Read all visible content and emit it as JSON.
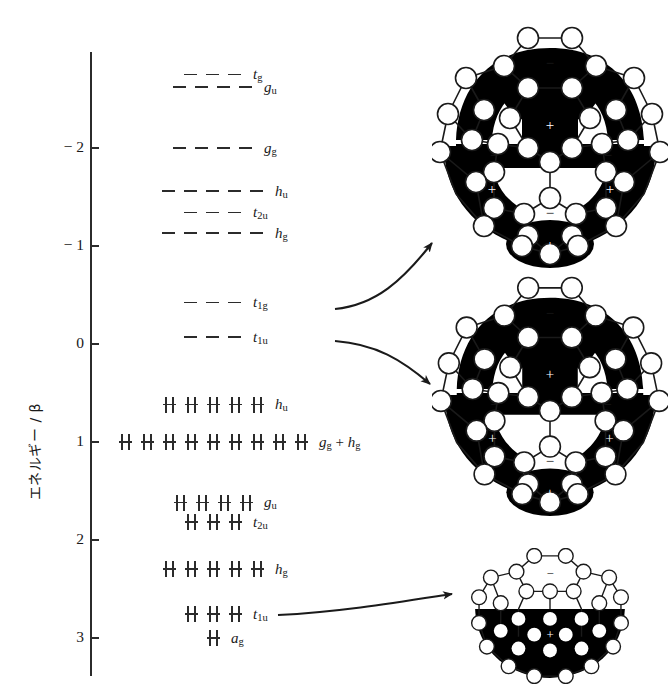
{
  "figure": {
    "type": "energy-level-diagram"
  },
  "axis": {
    "title": "エネルギー / β",
    "unit": "beta",
    "direction": "inverted (more negative upward)",
    "ticks": [
      {
        "label": "− 2",
        "value": -2
      },
      {
        "label": "− 1",
        "value": -1
      },
      {
        "label": "0",
        "value": 0
      },
      {
        "label": "1",
        "value": 1
      },
      {
        "label": "2",
        "value": 2
      },
      {
        "label": "3",
        "value": 3
      }
    ]
  },
  "chart_data": {
    "type": "table",
    "title": "エネルギー / β",
    "ylabel": "エネルギー / β",
    "ylim": [
      -2.8,
      3.3
    ],
    "grid": false,
    "legend": "none",
    "levels": [
      {
        "label": "t_g",
        "label_main": "t",
        "label_sub": "g",
        "degeneracy": 3,
        "energy": -2.75,
        "occupancy": "empty"
      },
      {
        "label": "g_u",
        "label_main": "g",
        "label_sub": "u",
        "degeneracy": 4,
        "energy": -2.62,
        "occupancy": "empty"
      },
      {
        "label": "g_g",
        "label_main": "g",
        "label_sub": "g",
        "degeneracy": 4,
        "energy": -2.0,
        "occupancy": "empty"
      },
      {
        "label": "h_u",
        "label_main": "h",
        "label_sub": "u",
        "degeneracy": 5,
        "energy": -1.56,
        "occupancy": "empty"
      },
      {
        "label": "t_2u",
        "label_main": "t",
        "label_sub": "2u",
        "degeneracy": 3,
        "energy": -1.34,
        "occupancy": "empty"
      },
      {
        "label": "h_g",
        "label_main": "h",
        "label_sub": "g",
        "degeneracy": 5,
        "energy": -1.13,
        "occupancy": "empty"
      },
      {
        "label": "t_1g",
        "label_main": "t",
        "label_sub": "1g",
        "degeneracy": 3,
        "energy": -0.42,
        "occupancy": "empty"
      },
      {
        "label": "t_1u",
        "label_main": "t",
        "label_sub": "1u",
        "degeneracy": 3,
        "energy": -0.07,
        "occupancy": "empty"
      },
      {
        "label": "h_u",
        "label_main": "h",
        "label_sub": "u",
        "degeneracy": 5,
        "energy": 0.62,
        "occupancy": "filled"
      },
      {
        "label": "g_g + h_g",
        "label_main": "g",
        "label_sub": "g",
        "degeneracy": 9,
        "energy": 1.0,
        "occupancy": "filled",
        "label_extra_plus": " + ",
        "label_main2": "h",
        "label_sub2": "g"
      },
      {
        "label": "g_u",
        "label_main": "g",
        "label_sub": "u",
        "degeneracy": 4,
        "energy": 1.62,
        "occupancy": "filled"
      },
      {
        "label": "t_2u",
        "label_main": "t",
        "label_sub": "2u",
        "degeneracy": 3,
        "energy": 1.82,
        "occupancy": "filled"
      },
      {
        "label": "h_g",
        "label_main": "h",
        "label_sub": "g",
        "degeneracy": 5,
        "energy": 2.3,
        "occupancy": "filled"
      },
      {
        "label": "t_1u",
        "label_main": "t",
        "label_sub": "1u",
        "degeneracy": 3,
        "energy": 2.76,
        "occupancy": "filled"
      },
      {
        "label": "a_g",
        "label_main": "a",
        "label_sub": "g",
        "degeneracy": 1,
        "energy": 3.0,
        "occupancy": "filled"
      }
    ]
  },
  "orbital_pictures": [
    {
      "name": "t1g-orbital",
      "linked_level": "t_1g",
      "sign_labels": [
        "−",
        "+",
        "−",
        "−",
        "+",
        "+",
        "−",
        "+"
      ]
    },
    {
      "name": "t1u-virtual-orbital",
      "linked_level": "t_1u",
      "sign_labels": [
        "−",
        "+",
        "−",
        "−",
        "+",
        "+",
        "−",
        "+"
      ]
    },
    {
      "name": "t1u-occupied-orbital",
      "linked_level": "t_1u",
      "sign_labels": [
        "−",
        "+"
      ]
    }
  ],
  "arrows": [
    {
      "name": "arrow-to-t1g-picture",
      "from": "t_1g level",
      "to": "top orbital picture"
    },
    {
      "name": "arrow-to-t1u-picture",
      "from": "t_1u level",
      "to": "middle orbital picture"
    },
    {
      "name": "arrow-to-t1u-occupied-picture",
      "from": "t_1u occupied level",
      "to": "bottom orbital picture"
    }
  ],
  "colors": {
    "ink": "#1a1a1a",
    "line": "#2b2b2b",
    "lobe_positive": "#000000",
    "lobe_negative": "#ffffff",
    "background": "#ffffff"
  }
}
